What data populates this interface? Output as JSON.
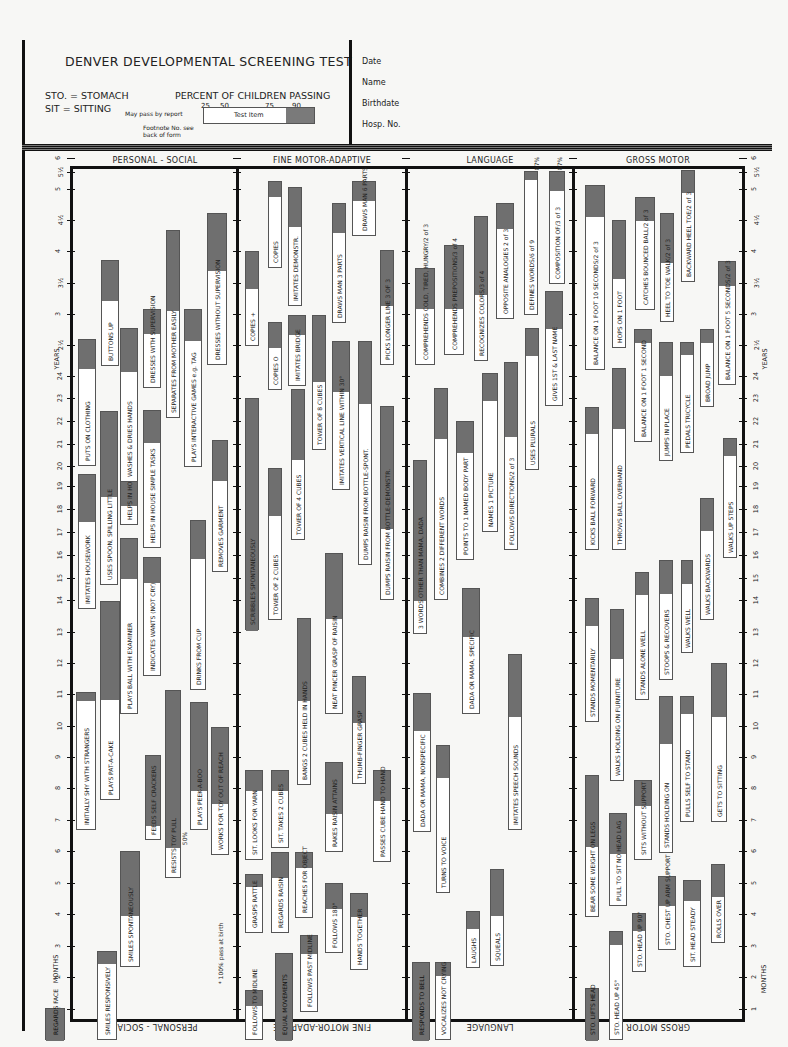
{
  "header": {
    "title": "DENVER DEVELOPMENTAL SCREENING TEST",
    "abbreviations": [
      "STO. = STOMACH",
      "SIT = SITTING"
    ],
    "percent_title": "PERCENT OF CHILDREN PASSING",
    "percent_ticks": [
      "25",
      "50",
      "75",
      "90"
    ],
    "legend_item": "Test Item",
    "legend_note_report": "May pass by report",
    "legend_note_footnote": "Footnote No. see back of form",
    "fields": [
      "Date",
      "Name",
      "Birthdate",
      "Hosp. No."
    ]
  },
  "columns": [
    {
      "title": "PERSONAL - SOCIAL"
    },
    {
      "title": "FINE MOTOR-ADAPTIVE"
    },
    {
      "title": "LANGUAGE"
    },
    {
      "title": "GROSS MOTOR"
    }
  ],
  "axis": {
    "years_label": "YEARS",
    "months_label": "MONTHS",
    "ticks": [
      {
        "label": "1",
        "y": 1009
      },
      {
        "label": "2",
        "y": 977
      },
      {
        "label": "3",
        "y": 946
      },
      {
        "label": "4",
        "y": 914
      },
      {
        "label": "5",
        "y": 883
      },
      {
        "label": "6",
        "y": 851
      },
      {
        "label": "7",
        "y": 820
      },
      {
        "label": "8",
        "y": 788
      },
      {
        "label": "9",
        "y": 757
      },
      {
        "label": "10",
        "y": 726
      },
      {
        "label": "11",
        "y": 694
      },
      {
        "label": "12",
        "y": 663
      },
      {
        "label": "13",
        "y": 632
      },
      {
        "label": "14",
        "y": 600
      },
      {
        "label": "15",
        "y": 578
      },
      {
        "label": "16",
        "y": 555
      },
      {
        "label": "17",
        "y": 532
      },
      {
        "label": "18",
        "y": 509
      },
      {
        "label": "19",
        "y": 486
      },
      {
        "label": "20",
        "y": 466
      },
      {
        "label": "21",
        "y": 444
      },
      {
        "label": "22",
        "y": 421
      },
      {
        "label": "23",
        "y": 398
      },
      {
        "label": "24",
        "y": 376
      },
      {
        "label": "2½",
        "y": 345
      },
      {
        "label": "3",
        "y": 314
      },
      {
        "label": "3½",
        "y": 283
      },
      {
        "label": "4",
        "y": 251
      },
      {
        "label": "4½",
        "y": 220
      },
      {
        "label": "5",
        "y": 189
      },
      {
        "label": "5½",
        "y": 172
      },
      {
        "label": "6",
        "y": 158
      }
    ]
  },
  "notes": {
    "birth_note": "* 100% pass at birth",
    "fifty_pct": "50%",
    "eighty_seven_a": "87%",
    "eighty_seven_b": "87%"
  },
  "items": [
    {
      "col": 0,
      "x": 45,
      "w": 20,
      "top": 1008,
      "split": 1008,
      "bottom": 1040,
      "label": "REGARDS FACE",
      "full": true
    },
    {
      "col": 0,
      "x": 97,
      "w": 20,
      "top": 951,
      "split": 963,
      "bottom": 1040,
      "label": "SMILES RESPONSIVELY"
    },
    {
      "col": 0,
      "x": 120,
      "w": 20,
      "top": 851,
      "split": 915,
      "bottom": 967,
      "label": "SMILES SPONTANEOUSLY"
    },
    {
      "col": 0,
      "x": 76,
      "w": 20,
      "top": 692,
      "split": 700,
      "bottom": 830,
      "label": "INITIALLY SHY WITH STRANGERS"
    },
    {
      "col": 0,
      "x": 100,
      "w": 20,
      "top": 601,
      "split": 699,
      "bottom": 800,
      "label": "PLAYS PAT-A-CAKE"
    },
    {
      "col": 0,
      "x": 145,
      "w": 16,
      "top": 755,
      "split": 825,
      "bottom": 840,
      "label": "FEEDS SELF CRACKERS"
    },
    {
      "col": 0,
      "x": 165,
      "w": 16,
      "top": 690,
      "split": 847,
      "bottom": 878,
      "label": "RESISTS TOY PULL"
    },
    {
      "col": 0,
      "x": 190,
      "w": 18,
      "top": 702,
      "split": 790,
      "bottom": 830,
      "label": "PLAYS PEEK-A-BOO"
    },
    {
      "col": 0,
      "x": 211,
      "w": 18,
      "top": 727,
      "split": 803,
      "bottom": 855,
      "label": "WORKS FOR TOY OUT OF REACH"
    },
    {
      "col": 0,
      "x": 120,
      "w": 18,
      "top": 538,
      "split": 578,
      "bottom": 714,
      "label": "PLAYS BALL WITH EXAMINER"
    },
    {
      "col": 0,
      "x": 143,
      "w": 18,
      "top": 557,
      "split": 582,
      "bottom": 676,
      "label": "INDICATES WANTS (NOT CRY)"
    },
    {
      "col": 0,
      "x": 190,
      "w": 16,
      "top": 520,
      "split": 558,
      "bottom": 690,
      "label": "DRINKS FROM CUP"
    },
    {
      "col": 0,
      "x": 78,
      "w": 18,
      "top": 474,
      "split": 521,
      "bottom": 609,
      "label": "IMITATES HOUSEWORK"
    },
    {
      "col": 0,
      "x": 100,
      "w": 18,
      "top": 411,
      "split": 496,
      "bottom": 585,
      "label": "USES SPOON, SPILLING LITTLE"
    },
    {
      "col": 0,
      "x": 120,
      "w": 18,
      "top": 398,
      "split": 505,
      "bottom": 525,
      "label": "HELPS IN HOUSE SIMPLE TASKS"
    },
    {
      "col": 0,
      "x": 143,
      "w": 18,
      "top": 410,
      "split": 442,
      "bottom": 548,
      "label": "HELPS IN HOUSE SIMPLE TASKS"
    },
    {
      "col": 0,
      "x": 212,
      "w": 16,
      "top": 440,
      "split": 480,
      "bottom": 572,
      "label": "REMOVES GARMENT"
    },
    {
      "col": 0,
      "x": 78,
      "w": 18,
      "top": 339,
      "split": 368,
      "bottom": 466,
      "label": "PUTS ON CLOTHING"
    },
    {
      "col": 0,
      "x": 101,
      "w": 18,
      "top": 260,
      "split": 300,
      "bottom": 366,
      "label": "BUTTONS UP"
    },
    {
      "col": 0,
      "x": 120,
      "w": 18,
      "top": 328,
      "split": 371,
      "bottom": 482,
      "label": "WASHES & DRIES HANDS"
    },
    {
      "col": 0,
      "x": 143,
      "w": 18,
      "top": 309,
      "split": 333,
      "bottom": 388,
      "label": "DRESSES WITH SUPERVISION"
    },
    {
      "col": 0,
      "x": 166,
      "w": 14,
      "top": 230,
      "split": 310,
      "bottom": 418,
      "label": "SEPARATES FROM MOTHER EASILY"
    },
    {
      "col": 0,
      "x": 184,
      "w": 18,
      "top": 309,
      "split": 340,
      "bottom": 467,
      "label": "PLAYS INTERACTIVE GAMES e.g. TAG"
    },
    {
      "col": 0,
      "x": 207,
      "w": 20,
      "top": 213,
      "split": 270,
      "bottom": 365,
      "label": "DRESSES WITHOUT SUPERVISION"
    },
    {
      "col": 1,
      "x": 245,
      "w": 18,
      "top": 990,
      "split": 1005,
      "bottom": 1040,
      "label": "FOLLOWS TO MIDLINE"
    },
    {
      "col": 1,
      "x": 275,
      "w": 18,
      "top": 953,
      "split": 1040,
      "bottom": 1040,
      "label": "EQUAL MOVEMENTS",
      "full": true
    },
    {
      "col": 1,
      "x": 300,
      "w": 18,
      "top": 935,
      "split": 953,
      "bottom": 1012,
      "label": "FOLLOWS PAST MIDLINE"
    },
    {
      "col": 1,
      "x": 325,
      "w": 18,
      "top": 883,
      "split": 908,
      "bottom": 953,
      "label": "FOLLOWS 180°"
    },
    {
      "col": 1,
      "x": 350,
      "w": 18,
      "top": 893,
      "split": 916,
      "bottom": 970,
      "label": "HANDS TOGETHER"
    },
    {
      "col": 1,
      "x": 245,
      "w": 18,
      "top": 874,
      "split": 886,
      "bottom": 933,
      "label": "GRASPS RATTLE"
    },
    {
      "col": 1,
      "x": 271,
      "w": 18,
      "top": 852,
      "split": 877,
      "bottom": 933,
      "label": "REGARDS RAISIN"
    },
    {
      "col": 1,
      "x": 295,
      "w": 18,
      "top": 852,
      "split": 867,
      "bottom": 918,
      "label": "REACHES FOR OBJECT"
    },
    {
      "col": 1,
      "x": 245,
      "w": 18,
      "top": 770,
      "split": 790,
      "bottom": 860,
      "label": "SIT. LOOKS FOR YARN"
    },
    {
      "col": 1,
      "x": 271,
      "w": 18,
      "top": 770,
      "split": 790,
      "bottom": 848,
      "label": "SIT. TAKES 2 CUBES"
    },
    {
      "col": 1,
      "x": 325,
      "w": 18,
      "top": 762,
      "split": 813,
      "bottom": 852,
      "label": "RAKES RAISIN ATTAINS"
    },
    {
      "col": 1,
      "x": 373,
      "w": 18,
      "top": 770,
      "split": 800,
      "bottom": 862,
      "label": "PASSES CUBE HAND TO HAND"
    },
    {
      "col": 1,
      "x": 297,
      "w": 14,
      "top": 618,
      "split": 700,
      "bottom": 785,
      "label": "BANGS 2 CUBES HELD IN HANDS"
    },
    {
      "col": 1,
      "x": 325,
      "w": 18,
      "top": 553,
      "split": 618,
      "bottom": 714,
      "label": "NEAT PINCER GRASP OF RAISIN"
    },
    {
      "col": 1,
      "x": 352,
      "w": 14,
      "top": 676,
      "split": 722,
      "bottom": 784,
      "label": "THUMB-FINGER GRASP"
    },
    {
      "col": 1,
      "x": 245,
      "w": 14,
      "top": 398,
      "split": 775,
      "bottom": 630,
      "label": "SCRIBBLES SPONTANEOUSLY"
    },
    {
      "col": 1,
      "x": 268,
      "w": 14,
      "top": 468,
      "split": 515,
      "bottom": 620,
      "label": "TOWER OF 2 CUBES"
    },
    {
      "col": 1,
      "x": 291,
      "w": 14,
      "top": 389,
      "split": 459,
      "bottom": 540,
      "label": "TOWER OF 4 CUBES"
    },
    {
      "col": 1,
      "x": 312,
      "w": 14,
      "top": 315,
      "split": 381,
      "bottom": 450,
      "label": "TOWER OF 8 CUBES"
    },
    {
      "col": 1,
      "x": 332,
      "w": 18,
      "top": 341,
      "split": 391,
      "bottom": 490,
      "label": "IMITATES VERTICAL LINE WITHIN 30°"
    },
    {
      "col": 1,
      "x": 358,
      "w": 14,
      "top": 341,
      "split": 403,
      "bottom": 565,
      "label": "DUMPS RAISIN FROM BOTTLE-SPONT."
    },
    {
      "col": 1,
      "x": 380,
      "w": 14,
      "top": 406,
      "split": 528,
      "bottom": 600,
      "label": "DUMPS RAISIN FROM BOTTLE-DEMONSTR."
    },
    {
      "col": 1,
      "x": 268,
      "w": 14,
      "top": 322,
      "split": 347,
      "bottom": 390,
      "label": "COPIES O"
    },
    {
      "col": 1,
      "x": 288,
      "w": 18,
      "top": 315,
      "split": 334,
      "bottom": 386,
      "label": "IMITATES BRIDGE"
    },
    {
      "col": 1,
      "x": 380,
      "w": 14,
      "top": 250,
      "split": 305,
      "bottom": 365,
      "label": "PICKS LONGER LINE 3 OF 3"
    },
    {
      "col": 1,
      "x": 245,
      "w": 14,
      "top": 251,
      "split": 288,
      "bottom": 346,
      "label": "COPIES +"
    },
    {
      "col": 1,
      "x": 268,
      "w": 14,
      "top": 181,
      "split": 196,
      "bottom": 268,
      "label": "COPIES"
    },
    {
      "col": 1,
      "x": 288,
      "w": 14,
      "top": 187,
      "split": 226,
      "bottom": 306,
      "label": "IMITATES DEMONSTR."
    },
    {
      "col": 1,
      "x": 332,
      "w": 14,
      "top": 203,
      "split": 232,
      "bottom": 323,
      "label": "DRAWS MAN 3 PARTS"
    },
    {
      "col": 1,
      "x": 352,
      "w": 24,
      "top": 181,
      "split": 200,
      "bottom": 236,
      "label": "DRAWS MAN 6 PARTS"
    },
    {
      "col": 2,
      "x": 412,
      "w": 18,
      "top": 962,
      "split": 1040,
      "bottom": 1040,
      "label": "RESPONDS TO BELL",
      "full": true
    },
    {
      "col": 2,
      "x": 435,
      "w": 16,
      "top": 962,
      "split": 975,
      "bottom": 1040,
      "label": "VOCALIZES NOT CRYING"
    },
    {
      "col": 2,
      "x": 466,
      "w": 14,
      "top": 911,
      "split": 928,
      "bottom": 968,
      "label": "LAUGHS"
    },
    {
      "col": 2,
      "x": 490,
      "w": 14,
      "top": 869,
      "split": 915,
      "bottom": 966,
      "label": "SQUEALS"
    },
    {
      "col": 2,
      "x": 413,
      "w": 18,
      "top": 693,
      "split": 730,
      "bottom": 832,
      "label": "DADA OR MAMA, NONSPECIFIC"
    },
    {
      "col": 2,
      "x": 436,
      "w": 14,
      "top": 745,
      "split": 777,
      "bottom": 893,
      "label": "TURNS TO VOICE"
    },
    {
      "col": 2,
      "x": 462,
      "w": 18,
      "top": 588,
      "split": 636,
      "bottom": 714,
      "label": "DADA OR MAMA, SPECIFIC"
    },
    {
      "col": 2,
      "x": 508,
      "w": 14,
      "top": 654,
      "split": 716,
      "bottom": 830,
      "label": "IMITATES SPEECH SOUNDS"
    },
    {
      "col": 2,
      "x": 413,
      "w": 14,
      "top": 460,
      "split": 600,
      "bottom": 634,
      "label": "3 WORDS OTHER THAN MAMA, DADA"
    },
    {
      "col": 2,
      "x": 434,
      "w": 14,
      "top": 388,
      "split": 438,
      "bottom": 600,
      "label": "COMBINES 2 DIFFERENT WORDS"
    },
    {
      "col": 2,
      "x": 456,
      "w": 18,
      "top": 421,
      "split": 452,
      "bottom": 560,
      "label": "POINTS TO 1 NAMED BODY PART"
    },
    {
      "col": 2,
      "x": 482,
      "w": 16,
      "top": 373,
      "split": 400,
      "bottom": 532,
      "label": "NAMES 1 PICTURE"
    },
    {
      "col": 2,
      "x": 504,
      "w": 14,
      "top": 362,
      "split": 436,
      "bottom": 550,
      "label": "FOLLOWS DIRECTIONS/2 of 3"
    },
    {
      "col": 2,
      "x": 525,
      "w": 14,
      "top": 328,
      "split": 355,
      "bottom": 470,
      "label": "USES PLURALS"
    },
    {
      "col": 2,
      "x": 545,
      "w": 18,
      "top": 291,
      "split": 328,
      "bottom": 406,
      "label": "GIVES 1ST & LAST NAME"
    },
    {
      "col": 2,
      "x": 415,
      "w": 20,
      "top": 268,
      "split": 308,
      "bottom": 365,
      "label": "COMPREHENDS COLD, TIRED, HUNGRY/2 of 3"
    },
    {
      "col": 2,
      "x": 444,
      "w": 20,
      "top": 245,
      "split": 308,
      "bottom": 355,
      "label": "COMPREHENDS PREPOSITIONS/3 of 4"
    },
    {
      "col": 2,
      "x": 474,
      "w": 14,
      "top": 216,
      "split": 294,
      "bottom": 361,
      "label": "RECOGNIZES COLORS/3 of 4"
    },
    {
      "col": 2,
      "x": 496,
      "w": 18,
      "top": 203,
      "split": 228,
      "bottom": 319,
      "label": "OPPOSITE ANALOGIES 2 of 3"
    },
    {
      "col": 2,
      "x": 524,
      "w": 14,
      "top": 171,
      "split": 179,
      "bottom": 315,
      "label": "DEFINES WORDS/6 of 9"
    },
    {
      "col": 2,
      "x": 549,
      "w": 16,
      "top": 171,
      "split": 190,
      "bottom": 284,
      "label": "COMPOSITION OF/3 of 3"
    },
    {
      "col": 3,
      "x": 585,
      "w": 14,
      "top": 988,
      "split": 1040,
      "bottom": 1040,
      "label": "STO. LIFTS HEAD",
      "full": true
    },
    {
      "col": 3,
      "x": 609,
      "w": 14,
      "top": 931,
      "split": 944,
      "bottom": 1040,
      "label": "STO. HEAD UP 45°"
    },
    {
      "col": 3,
      "x": 632,
      "w": 14,
      "top": 913,
      "split": 930,
      "bottom": 972,
      "label": "STO. HEAD UP 90°"
    },
    {
      "col": 3,
      "x": 658,
      "w": 18,
      "top": 876,
      "split": 905,
      "bottom": 950,
      "label": "STO. CHEST UP ARM SUPPORT"
    },
    {
      "col": 3,
      "x": 683,
      "w": 18,
      "top": 880,
      "split": 900,
      "bottom": 967,
      "label": "SIT. HEAD STEADY"
    },
    {
      "col": 3,
      "x": 711,
      "w": 14,
      "top": 864,
      "split": 896,
      "bottom": 943,
      "label": "ROLLS OVER"
    },
    {
      "col": 3,
      "x": 585,
      "w": 14,
      "top": 775,
      "split": 846,
      "bottom": 917,
      "label": "BEAR SOME WEIGHT ON LEGS"
    },
    {
      "col": 3,
      "x": 609,
      "w": 18,
      "top": 813,
      "split": 853,
      "bottom": 906,
      "label": "PULL TO SIT NO HEAD LAG"
    },
    {
      "col": 3,
      "x": 634,
      "w": 18,
      "top": 780,
      "split": 805,
      "bottom": 860,
      "label": "SITS WITHOUT SUPPORT"
    },
    {
      "col": 3,
      "x": 659,
      "w": 14,
      "top": 696,
      "split": 743,
      "bottom": 853,
      "label": "STANDS HOLDING ON"
    },
    {
      "col": 3,
      "x": 680,
      "w": 14,
      "top": 696,
      "split": 713,
      "bottom": 822,
      "label": "PULLS SELF TO STAND"
    },
    {
      "col": 3,
      "x": 711,
      "w": 16,
      "top": 663,
      "split": 716,
      "bottom": 822,
      "label": "GETS TO SITTING"
    },
    {
      "col": 3,
      "x": 585,
      "w": 14,
      "top": 598,
      "split": 625,
      "bottom": 722,
      "label": "STANDS MOMENTARILY"
    },
    {
      "col": 3,
      "x": 610,
      "w": 14,
      "top": 609,
      "split": 658,
      "bottom": 781,
      "label": "WALKS HOLDING ON FURNITURE"
    },
    {
      "col": 3,
      "x": 635,
      "w": 14,
      "top": 572,
      "split": 594,
      "bottom": 700,
      "label": "STANDS ALONE WELL"
    },
    {
      "col": 3,
      "x": 659,
      "w": 14,
      "top": 560,
      "split": 593,
      "bottom": 680,
      "label": "STOOPS & RECOVERS"
    },
    {
      "col": 3,
      "x": 681,
      "w": 12,
      "top": 560,
      "split": 583,
      "bottom": 653,
      "label": "WALKS WELL"
    },
    {
      "col": 3,
      "x": 700,
      "w": 14,
      "top": 498,
      "split": 530,
      "bottom": 620,
      "label": "WALKS BACKWARDS"
    },
    {
      "col": 3,
      "x": 723,
      "w": 14,
      "top": 438,
      "split": 455,
      "bottom": 558,
      "label": "WALKS UP STEPS"
    },
    {
      "col": 3,
      "x": 585,
      "w": 14,
      "top": 407,
      "split": 433,
      "bottom": 550,
      "label": "KICKS BALL FORWARD"
    },
    {
      "col": 3,
      "x": 612,
      "w": 14,
      "top": 368,
      "split": 428,
      "bottom": 550,
      "label": "THROWS BALL OVERHAND"
    },
    {
      "col": 3,
      "x": 634,
      "w": 18,
      "top": 329,
      "split": 342,
      "bottom": 442,
      "label": "BALANCE ON 1 FOOT 1 SECOND"
    },
    {
      "col": 3,
      "x": 659,
      "w": 14,
      "top": 342,
      "split": 375,
      "bottom": 461,
      "label": "JUMPS IN PLACE"
    },
    {
      "col": 3,
      "x": 680,
      "w": 14,
      "top": 342,
      "split": 354,
      "bottom": 453,
      "label": "PEDALS TRICYCLE"
    },
    {
      "col": 3,
      "x": 700,
      "w": 14,
      "top": 329,
      "split": 342,
      "bottom": 407,
      "label": "BROAD JUMP"
    },
    {
      "col": 3,
      "x": 718,
      "w": 18,
      "top": 261,
      "split": 285,
      "bottom": 385,
      "label": "BALANCE ON 1 FOOT 5 SECONDS/2 of 3"
    },
    {
      "col": 3,
      "x": 585,
      "w": 20,
      "top": 185,
      "split": 216,
      "bottom": 370,
      "label": "BALANCE ON 1 FOOT 10 SECONDS/2 of 3"
    },
    {
      "col": 3,
      "x": 612,
      "w": 14,
      "top": 220,
      "split": 278,
      "bottom": 348,
      "label": "HOPS ON 1 FOOT"
    },
    {
      "col": 3,
      "x": 635,
      "w": 20,
      "top": 197,
      "split": 220,
      "bottom": 310,
      "label": "CATCHES BOUNCED BALL/2 of 3"
    },
    {
      "col": 3,
      "x": 660,
      "w": 14,
      "top": 213,
      "split": 262,
      "bottom": 322,
      "label": "HEEL TO TOE WALK/2 of 3"
    },
    {
      "col": 3,
      "x": 681,
      "w": 14,
      "top": 170,
      "split": 192,
      "bottom": 282,
      "label": "BACKWARD HEEL TOE/2 of 3"
    }
  ]
}
